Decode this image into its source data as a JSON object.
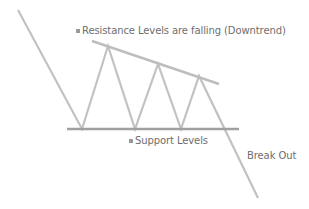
{
  "diagram": {
    "labels": {
      "resistance": "Resistance Levels are falling (Downtrend)",
      "support": "Support Levels",
      "breakout": "Break Out"
    },
    "colors": {
      "line": "#bdbdbd",
      "support_line": "#9e9e9e",
      "text": "#6e6e6e",
      "background": "#ffffff"
    },
    "price_path": [
      [
        18,
        10
      ],
      [
        82,
        129
      ],
      [
        108,
        46
      ],
      [
        135,
        129
      ],
      [
        158,
        64
      ],
      [
        181,
        129
      ],
      [
        199,
        76
      ],
      [
        258,
        198
      ]
    ],
    "resistance_line": [
      [
        92,
        41
      ],
      [
        219,
        84
      ]
    ],
    "support_line": [
      [
        67,
        129
      ],
      [
        239,
        129
      ]
    ]
  }
}
